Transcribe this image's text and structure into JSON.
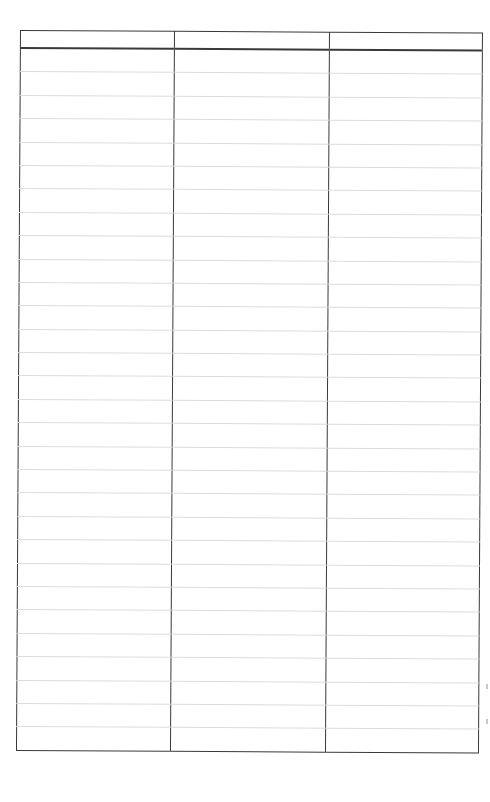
{
  "document": {
    "type": "blank-ruled-table",
    "columns": 3,
    "body_rows": 30
  },
  "table": {
    "headers": [
      "",
      "",
      ""
    ],
    "rows": [
      [
        "",
        "",
        ""
      ],
      [
        "",
        "",
        ""
      ],
      [
        "",
        "",
        ""
      ],
      [
        "",
        "",
        ""
      ],
      [
        "",
        "",
        ""
      ],
      [
        "",
        "",
        ""
      ],
      [
        "",
        "",
        ""
      ],
      [
        "",
        "",
        ""
      ],
      [
        "",
        "",
        ""
      ],
      [
        "",
        "",
        ""
      ],
      [
        "",
        "",
        ""
      ],
      [
        "",
        "",
        ""
      ],
      [
        "",
        "",
        ""
      ],
      [
        "",
        "",
        ""
      ],
      [
        "",
        "",
        ""
      ],
      [
        "",
        "",
        ""
      ],
      [
        "",
        "",
        ""
      ],
      [
        "",
        "",
        ""
      ],
      [
        "",
        "",
        ""
      ],
      [
        "",
        "",
        ""
      ],
      [
        "",
        "",
        ""
      ],
      [
        "",
        "",
        ""
      ],
      [
        "",
        "",
        ""
      ],
      [
        "",
        "",
        ""
      ],
      [
        "",
        "",
        ""
      ],
      [
        "",
        "",
        ""
      ],
      [
        "",
        "",
        ""
      ],
      [
        "",
        "",
        ""
      ],
      [
        "",
        "",
        ""
      ],
      [
        "",
        "",
        ""
      ]
    ]
  },
  "colors": {
    "border": "#3a3a3a",
    "rule": "#dcdcdc",
    "background": "#ffffff"
  }
}
